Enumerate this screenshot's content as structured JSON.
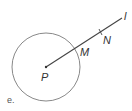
{
  "figure": {
    "caption": "e.",
    "colors": {
      "stroke": "#6e6e6e",
      "line": "#444444",
      "text": "#333333"
    },
    "circle": {
      "center_label": "P",
      "cx": 46,
      "cy": 67,
      "r": 34
    },
    "line": {
      "label": "l",
      "from": [
        46,
        67
      ],
      "to": [
        122,
        18
      ]
    },
    "points": [
      {
        "label": "P",
        "x": 46,
        "y": 67
      },
      {
        "label": "M",
        "x": 76,
        "y": 48
      },
      {
        "label": "N",
        "x": 101,
        "y": 32
      }
    ],
    "labels": {
      "P": "P",
      "M": "M",
      "N": "N",
      "l": "l"
    }
  }
}
